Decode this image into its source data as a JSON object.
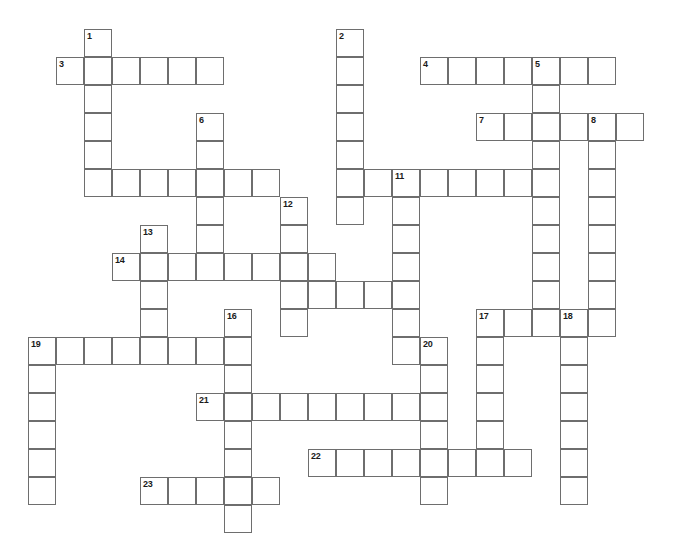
{
  "puzzle": {
    "title": "Crossword Puzzle Grid",
    "type": "crossword-grid",
    "cell_size_px": 28,
    "origin_x_px": 0,
    "origin_y_px": 1,
    "canvas": {
      "width": 682,
      "height": 517
    },
    "colors": {
      "background": "#ffffff",
      "cell_fill": "#ffffff",
      "cell_border": "#6e6e6e",
      "number_text": "#1b1b1b"
    },
    "entries": [
      {
        "number": "1",
        "direction": "down",
        "col": 3,
        "row": 1,
        "length": 6
      },
      {
        "number": "2",
        "direction": "down",
        "col": 12,
        "row": 1,
        "length": 7
      },
      {
        "number": "3",
        "direction": "across",
        "col": 2,
        "row": 2,
        "length": 6
      },
      {
        "number": "4",
        "direction": "across",
        "col": 15,
        "row": 2,
        "length": 7
      },
      {
        "number": "5",
        "direction": "down",
        "col": 19,
        "row": 2,
        "length": 9
      },
      {
        "number": "6",
        "direction": "down",
        "col": 7,
        "row": 4,
        "length": 5
      },
      {
        "number": "7",
        "direction": "across",
        "col": 17,
        "row": 4,
        "length": 6
      },
      {
        "number": "8",
        "direction": "down",
        "col": 21,
        "row": 4,
        "length": 7
      },
      {
        "number": "9",
        "direction": "across",
        "col": 3,
        "row": 6,
        "length": 7
      },
      {
        "number": "10",
        "direction": "across",
        "col": 12,
        "row": 6,
        "length": 8
      },
      {
        "number": "11",
        "direction": "down",
        "col": 14,
        "row": 6,
        "length": 7
      },
      {
        "number": "12",
        "direction": "down",
        "col": 10,
        "row": 7,
        "length": 5
      },
      {
        "number": "13",
        "direction": "down",
        "col": 5,
        "row": 8,
        "length": 5
      },
      {
        "number": "14",
        "direction": "across",
        "col": 4,
        "row": 9,
        "length": 8
      },
      {
        "number": "15",
        "direction": "across",
        "col": 10,
        "row": 10,
        "length": 5
      },
      {
        "number": "16",
        "direction": "down",
        "col": 8,
        "row": 11,
        "length": 9
      },
      {
        "number": "17",
        "direction": "across",
        "col": 17,
        "row": 11,
        "length": 6
      },
      {
        "number": "18",
        "direction": "down",
        "col": 20,
        "row": 11,
        "length": 7
      },
      {
        "number": "19",
        "direction": "across",
        "col": 1,
        "row": 12,
        "length": 7
      },
      {
        "number": "20",
        "direction": "down",
        "col": 15,
        "row": 12,
        "length": 7
      },
      {
        "number": "21",
        "direction": "across",
        "col": 7,
        "row": 14,
        "length": 8
      },
      {
        "number": "22",
        "direction": "across",
        "col": 11,
        "row": 16,
        "length": 8
      },
      {
        "number": "23",
        "direction": "across",
        "col": 5,
        "row": 17,
        "length": 5
      },
      {
        "number": "19v",
        "direction": "down",
        "col": 1,
        "row": 12,
        "length": 6
      },
      {
        "number": "1x",
        "direction": "across",
        "col": 3,
        "row": 2,
        "length": 0
      }
    ],
    "cells": [
      {
        "col": 3,
        "row": 1,
        "num": "1"
      },
      {
        "col": 3,
        "row": 2
      },
      {
        "col": 3,
        "row": 3
      },
      {
        "col": 3,
        "row": 4
      },
      {
        "col": 3,
        "row": 5
      },
      {
        "col": 3,
        "row": 6
      },
      {
        "col": 2,
        "row": 2,
        "num": "3"
      },
      {
        "col": 4,
        "row": 2
      },
      {
        "col": 5,
        "row": 2
      },
      {
        "col": 6,
        "row": 2
      },
      {
        "col": 7,
        "row": 2
      },
      {
        "col": 12,
        "row": 1,
        "num": "2"
      },
      {
        "col": 12,
        "row": 2
      },
      {
        "col": 12,
        "row": 3
      },
      {
        "col": 12,
        "row": 4
      },
      {
        "col": 12,
        "row": 5
      },
      {
        "col": 12,
        "row": 6
      },
      {
        "col": 12,
        "row": 7
      },
      {
        "col": 15,
        "row": 2,
        "num": "4"
      },
      {
        "col": 16,
        "row": 2
      },
      {
        "col": 17,
        "row": 2
      },
      {
        "col": 18,
        "row": 2
      },
      {
        "col": 19,
        "row": 2,
        "num": "5"
      },
      {
        "col": 20,
        "row": 2
      },
      {
        "col": 21,
        "row": 2
      },
      {
        "col": 19,
        "row": 3
      },
      {
        "col": 19,
        "row": 4
      },
      {
        "col": 19,
        "row": 5
      },
      {
        "col": 19,
        "row": 6
      },
      {
        "col": 19,
        "row": 7
      },
      {
        "col": 19,
        "row": 8
      },
      {
        "col": 19,
        "row": 9
      },
      {
        "col": 19,
        "row": 10
      },
      {
        "col": 7,
        "row": 4,
        "num": "6"
      },
      {
        "col": 7,
        "row": 5
      },
      {
        "col": 7,
        "row": 6
      },
      {
        "col": 7,
        "row": 7
      },
      {
        "col": 7,
        "row": 8
      },
      {
        "col": 17,
        "row": 4,
        "num": "7"
      },
      {
        "col": 18,
        "row": 4
      },
      {
        "col": 20,
        "row": 4
      },
      {
        "col": 21,
        "row": 4,
        "num": "8"
      },
      {
        "col": 22,
        "row": 4
      },
      {
        "col": 21,
        "row": 5
      },
      {
        "col": 21,
        "row": 6
      },
      {
        "col": 21,
        "row": 7
      },
      {
        "col": 21,
        "row": 8
      },
      {
        "col": 21,
        "row": 9
      },
      {
        "col": 21,
        "row": 10
      },
      {
        "col": 4,
        "row": 6
      },
      {
        "col": 5,
        "row": 6
      },
      {
        "col": 6,
        "row": 6
      },
      {
        "col": 8,
        "row": 6
      },
      {
        "col": 9,
        "row": 6
      },
      {
        "col": 13,
        "row": 6
      },
      {
        "col": 14,
        "row": 6,
        "num": "11"
      },
      {
        "col": 15,
        "row": 6
      },
      {
        "col": 16,
        "row": 6
      },
      {
        "col": 17,
        "row": 6
      },
      {
        "col": 18,
        "row": 6
      },
      {
        "col": 14,
        "row": 7
      },
      {
        "col": 14,
        "row": 8
      },
      {
        "col": 14,
        "row": 9
      },
      {
        "col": 14,
        "row": 10
      },
      {
        "col": 14,
        "row": 11
      },
      {
        "col": 14,
        "row": 12
      },
      {
        "col": 10,
        "row": 7,
        "num": "12"
      },
      {
        "col": 10,
        "row": 8
      },
      {
        "col": 10,
        "row": 9
      },
      {
        "col": 10,
        "row": 10
      },
      {
        "col": 10,
        "row": 11
      },
      {
        "col": 5,
        "row": 8,
        "num": "13"
      },
      {
        "col": 5,
        "row": 9
      },
      {
        "col": 5,
        "row": 10
      },
      {
        "col": 5,
        "row": 11
      },
      {
        "col": 5,
        "row": 12
      },
      {
        "col": 4,
        "row": 9,
        "num": "14"
      },
      {
        "col": 6,
        "row": 9
      },
      {
        "col": 7,
        "row": 9
      },
      {
        "col": 8,
        "row": 9
      },
      {
        "col": 9,
        "row": 9
      },
      {
        "col": 11,
        "row": 9
      },
      {
        "col": 11,
        "row": 10
      },
      {
        "col": 12,
        "row": 10
      },
      {
        "col": 13,
        "row": 10
      },
      {
        "col": 8,
        "row": 11,
        "num": "16"
      },
      {
        "col": 8,
        "row": 12
      },
      {
        "col": 8,
        "row": 13
      },
      {
        "col": 8,
        "row": 14
      },
      {
        "col": 8,
        "row": 15
      },
      {
        "col": 8,
        "row": 16
      },
      {
        "col": 8,
        "row": 17
      },
      {
        "col": 8,
        "row": 18
      },
      {
        "col": 17,
        "row": 11,
        "num": "17"
      },
      {
        "col": 18,
        "row": 11
      },
      {
        "col": 19,
        "row": 11
      },
      {
        "col": 20,
        "row": 11,
        "num": "18"
      },
      {
        "col": 21,
        "row": 11
      },
      {
        "col": 17,
        "row": 12
      },
      {
        "col": 17,
        "row": 13
      },
      {
        "col": 17,
        "row": 14
      },
      {
        "col": 17,
        "row": 15
      },
      {
        "col": 17,
        "row": 16
      },
      {
        "col": 20,
        "row": 12
      },
      {
        "col": 20,
        "row": 13
      },
      {
        "col": 20,
        "row": 14
      },
      {
        "col": 20,
        "row": 15
      },
      {
        "col": 20,
        "row": 16
      },
      {
        "col": 20,
        "row": 17
      },
      {
        "col": 1,
        "row": 12,
        "num": "19"
      },
      {
        "col": 2,
        "row": 12
      },
      {
        "col": 3,
        "row": 12
      },
      {
        "col": 4,
        "row": 12
      },
      {
        "col": 6,
        "row": 12
      },
      {
        "col": 7,
        "row": 12
      },
      {
        "col": 1,
        "row": 13
      },
      {
        "col": 1,
        "row": 14
      },
      {
        "col": 1,
        "row": 15
      },
      {
        "col": 1,
        "row": 16
      },
      {
        "col": 1,
        "row": 17
      },
      {
        "col": 15,
        "row": 12,
        "num": "20"
      },
      {
        "col": 15,
        "row": 13
      },
      {
        "col": 15,
        "row": 14
      },
      {
        "col": 15,
        "row": 15
      },
      {
        "col": 15,
        "row": 16
      },
      {
        "col": 15,
        "row": 17
      },
      {
        "col": 7,
        "row": 14,
        "num": "21"
      },
      {
        "col": 9,
        "row": 14
      },
      {
        "col": 10,
        "row": 14
      },
      {
        "col": 11,
        "row": 14
      },
      {
        "col": 12,
        "row": 14
      },
      {
        "col": 13,
        "row": 14
      },
      {
        "col": 14,
        "row": 14
      },
      {
        "col": 11,
        "row": 16,
        "num": "22"
      },
      {
        "col": 12,
        "row": 16
      },
      {
        "col": 13,
        "row": 16
      },
      {
        "col": 14,
        "row": 16
      },
      {
        "col": 16,
        "row": 16
      },
      {
        "col": 18,
        "row": 16
      },
      {
        "col": 5,
        "row": 17,
        "num": "23"
      },
      {
        "col": 6,
        "row": 17
      },
      {
        "col": 7,
        "row": 17
      },
      {
        "col": 9,
        "row": 17
      }
    ]
  }
}
